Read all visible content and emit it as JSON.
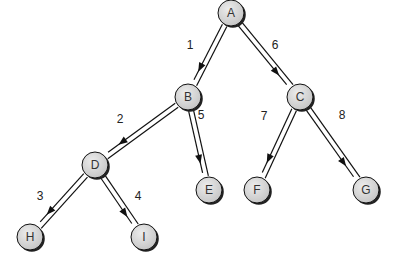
{
  "diagram": {
    "type": "tree-traversal",
    "nodes": [
      {
        "id": "A",
        "label": "A",
        "x": 231,
        "y": 13
      },
      {
        "id": "B",
        "label": "B",
        "x": 188,
        "y": 97
      },
      {
        "id": "C",
        "label": "C",
        "x": 300,
        "y": 97
      },
      {
        "id": "D",
        "label": "D",
        "x": 95,
        "y": 165
      },
      {
        "id": "E",
        "label": "E",
        "x": 209,
        "y": 190
      },
      {
        "id": "F",
        "label": "F",
        "x": 257,
        "y": 190
      },
      {
        "id": "G",
        "label": "G",
        "x": 366,
        "y": 190
      },
      {
        "id": "H",
        "label": "H",
        "x": 30,
        "y": 237
      },
      {
        "id": "I",
        "label": "I",
        "x": 144,
        "y": 237
      }
    ],
    "edges": [
      {
        "from": "A",
        "to": "B",
        "label": "1",
        "lx": 190,
        "ly": 46
      },
      {
        "from": "B",
        "to": "D",
        "label": "2",
        "lx": 120,
        "ly": 120
      },
      {
        "from": "D",
        "to": "H",
        "label": "3",
        "lx": 40,
        "ly": 197
      },
      {
        "from": "D",
        "to": "I",
        "label": "4",
        "lx": 138,
        "ly": 197
      },
      {
        "from": "B",
        "to": "E",
        "label": "5",
        "lx": 201,
        "ly": 116
      },
      {
        "from": "A",
        "to": "C",
        "label": "6",
        "lx": 275,
        "ly": 46
      },
      {
        "from": "C",
        "to": "F",
        "label": "7",
        "lx": 264,
        "ly": 117
      },
      {
        "from": "C",
        "to": "G",
        "label": "8",
        "lx": 342,
        "ly": 116
      }
    ],
    "colors": {
      "node_fill": "#d6d6d6",
      "node_stroke": "#111111",
      "node_shadow": "#222222",
      "edge": "#111111"
    }
  }
}
